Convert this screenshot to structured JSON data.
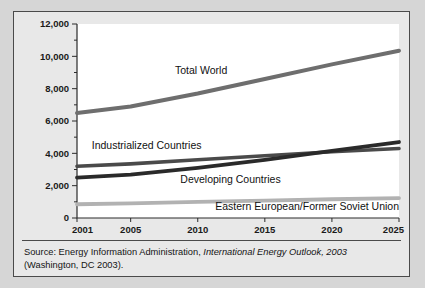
{
  "figure": {
    "background": "#e8e8e8",
    "border_color": "#4a4a4a",
    "plot_background": "#ffffff"
  },
  "source": {
    "prefix": "Source: Energy Information Administration, ",
    "italic_title": "International Energy Outlook, 2003",
    "suffix": " (Washington, DC 2003)."
  },
  "chart_data": {
    "type": "line",
    "title": "",
    "xlabel": "",
    "ylabel": "",
    "xlim": [
      2001,
      2025
    ],
    "ylim": [
      0,
      12000
    ],
    "grid": false,
    "legend": "inline-labels",
    "xticks": [
      2001,
      2005,
      2010,
      2015,
      2020,
      2025
    ],
    "xtick_labels": [
      "2001",
      "2005",
      "2010",
      "2015",
      "2020",
      "2025"
    ],
    "yticks": [
      0,
      2000,
      4000,
      6000,
      8000,
      10000,
      12000
    ],
    "ytick_labels": [
      "0",
      "2,000",
      "4,000",
      "6,000",
      "8,000",
      "10,000",
      "12,000"
    ],
    "minor_yticks": [
      1000,
      3000,
      5000,
      7000,
      9000,
      11000
    ],
    "x": [
      2001,
      2005,
      2010,
      2015,
      2020,
      2025
    ],
    "series": [
      {
        "name": "Total World",
        "color": "#6e6e6e",
        "width": 4.0,
        "values": [
          6500,
          6900,
          7700,
          8600,
          9500,
          10350
        ],
        "label_x": 2008.3,
        "label_y": 8900
      },
      {
        "name": "Industrialized Countries",
        "color": "#4a4a4a",
        "width": 3.6,
        "values": [
          3200,
          3350,
          3600,
          3850,
          4100,
          4300
        ],
        "label_x": 2002.1,
        "label_y": 4250
      },
      {
        "name": "Developing Countries",
        "color": "#2a2a2a",
        "width": 3.8,
        "values": [
          2500,
          2680,
          3100,
          3600,
          4150,
          4700
        ],
        "label_x": 2008.7,
        "label_y": 2150
      },
      {
        "name": "Eastern European/Former Soviet Union",
        "color": "#b2b2b2",
        "width": 3.8,
        "values": [
          850,
          900,
          1000,
          1080,
          1160,
          1230
        ],
        "label_x": 2011.3,
        "label_y": 480
      }
    ]
  }
}
